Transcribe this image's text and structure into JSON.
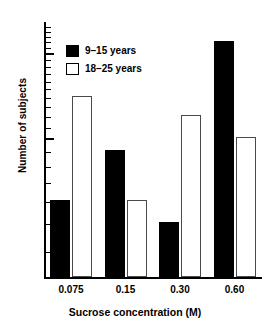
{
  "chart_data": {
    "type": "bar",
    "title": "",
    "xlabel": "Sucrose concentration (M)",
    "ylabel": "Number of subjects",
    "categories": [
      "0.075",
      "0.15",
      "0.30",
      "0.60"
    ],
    "series": [
      {
        "name": "9-15 years",
        "color": "#000000",
        "fill": "solid",
        "values": [
          6,
          9,
          5,
          22
        ]
      },
      {
        "name": "18-25 years",
        "color": "#ffffff",
        "fill": "open",
        "values": [
          14,
          6,
          12,
          10
        ]
      }
    ],
    "yscale": "log",
    "ylim": [
      3.2,
      26
    ],
    "yticks_major": [
      10,
      20
    ],
    "yticklabels": [
      "10",
      "20"
    ],
    "yticks_minor": [
      4,
      5,
      6,
      7,
      8,
      9,
      11,
      12,
      13,
      14,
      15,
      16,
      17,
      18,
      19,
      21,
      22,
      23,
      24,
      25
    ],
    "grid": false,
    "legend_position": "upper-left-inside"
  },
  "legend": {
    "entries": [
      {
        "label": "9–15 years",
        "swatch": "filled-black-square"
      },
      {
        "label": "18–25 years",
        "swatch": "open-white-square"
      }
    ]
  },
  "axes": {
    "y_title": "Number of subjects",
    "x_title": "Sucrose concentration (M)",
    "y_tick_labels": [
      "20",
      "10"
    ],
    "x_tick_labels": [
      "0.075",
      "0.15",
      "0.30",
      "0.60"
    ]
  }
}
